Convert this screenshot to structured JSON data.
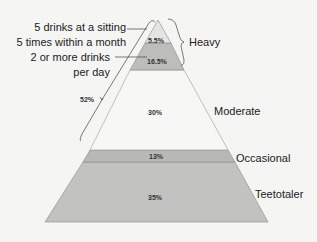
{
  "diagram": {
    "type": "pyramid",
    "bands": [
      {
        "id": "heavy-top",
        "percent": "5.5%",
        "color": "#e4e4e2"
      },
      {
        "id": "heavy-bottom",
        "percent": "16.5%",
        "color": "#bdbdbb"
      },
      {
        "id": "moderate",
        "percent": "30%",
        "color": "#f7f7f6"
      },
      {
        "id": "occasional",
        "percent": "13%",
        "color": "#b8b8b6"
      },
      {
        "id": "teetotaler",
        "percent": "35%",
        "color": "#c2c2c0"
      }
    ],
    "category_labels": {
      "heavy": "Heavy",
      "moderate": "Moderate",
      "occasional": "Occasional",
      "teetotaler": "Teetotaler"
    },
    "annotations": {
      "binge_line1": "5 drinks at a sitting",
      "binge_line2": "5 times within a month",
      "daily_line1": "2 or more drinks",
      "daily_line2": "per day",
      "bracket_percent": "52%"
    }
  }
}
